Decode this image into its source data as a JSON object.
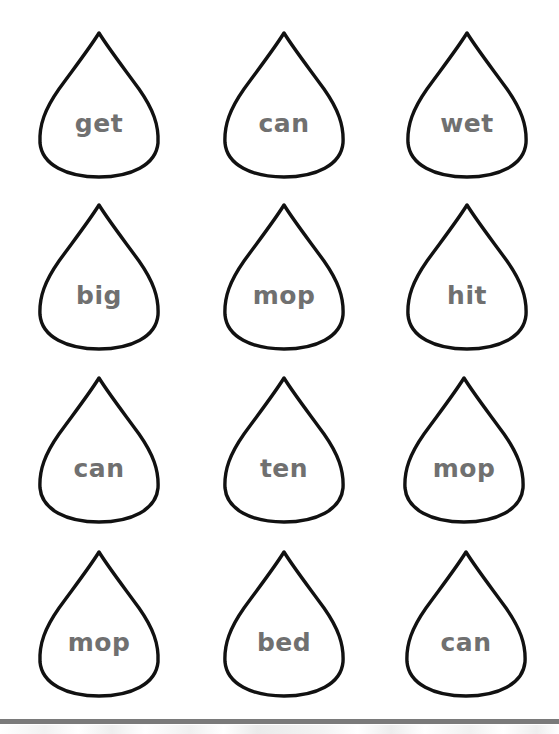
{
  "worksheet": {
    "style": {
      "outline_color": "#111111",
      "word_color": "#707070",
      "bar_color": "#7a7a7a"
    },
    "drops": [
      {
        "row": 1,
        "col": 1,
        "word": "get"
      },
      {
        "row": 1,
        "col": 2,
        "word": "can"
      },
      {
        "row": 1,
        "col": 3,
        "word": "wet"
      },
      {
        "row": 2,
        "col": 1,
        "word": "big"
      },
      {
        "row": 2,
        "col": 2,
        "word": "mop"
      },
      {
        "row": 2,
        "col": 3,
        "word": "hit"
      },
      {
        "row": 3,
        "col": 1,
        "word": "can"
      },
      {
        "row": 3,
        "col": 2,
        "word": "ten"
      },
      {
        "row": 3,
        "col": 3,
        "word": "mop"
      },
      {
        "row": 4,
        "col": 1,
        "word": "mop"
      },
      {
        "row": 4,
        "col": 2,
        "word": "bed"
      },
      {
        "row": 4,
        "col": 3,
        "word": "can"
      }
    ]
  }
}
